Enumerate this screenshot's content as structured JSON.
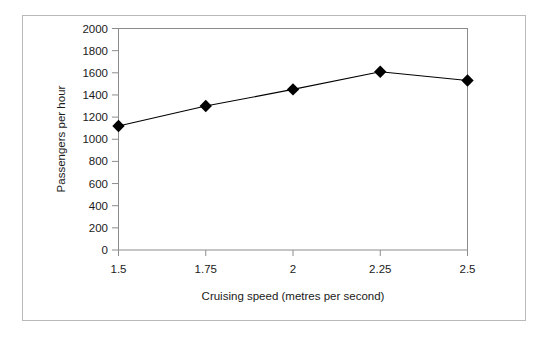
{
  "chart_data": {
    "type": "line",
    "title": "",
    "subtitle": "",
    "xlabel": "Cruising speed (metres per second)",
    "ylabel": "Passengers per hour",
    "x": [
      1.5,
      1.75,
      2,
      2.25,
      2.5
    ],
    "xtick_labels": [
      "1.5",
      "1.75",
      "2",
      "2.25",
      "2.5"
    ],
    "values": [
      1120,
      1300,
      1450,
      1610,
      1530
    ],
    "series": [
      {
        "name": "Passengers per hour",
        "values": [
          1120,
          1300,
          1450,
          1610,
          1530
        ]
      }
    ],
    "ylim": [
      0,
      2000
    ],
    "xlim": [
      1.5,
      2.5
    ],
    "yticks": [
      0,
      200,
      400,
      600,
      800,
      1000,
      1200,
      1400,
      1600,
      1800,
      2000
    ],
    "ytick_labels": [
      "0",
      "200",
      "400",
      "600",
      "800",
      "1000",
      "1200",
      "1400",
      "1600",
      "1800",
      "2000"
    ],
    "grid": false,
    "legend": false,
    "legend_position": "none",
    "marker": "diamond",
    "marker_color": "#000000",
    "line_color": "#000000",
    "plot_border_color": "#8c8c8c",
    "figure_border_color": "#b9b9b9",
    "background_color": "#ffffff",
    "annotations": []
  }
}
